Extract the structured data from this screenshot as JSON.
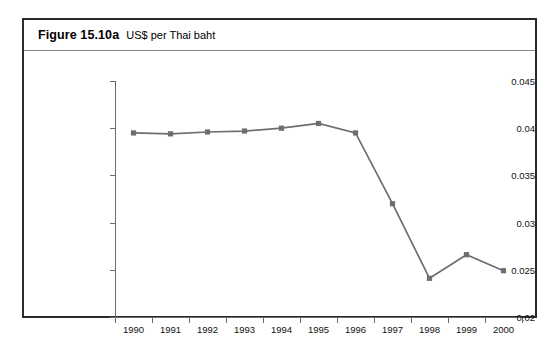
{
  "figure": {
    "number": "Figure 15.10a",
    "caption": "US$ per Thai baht"
  },
  "chart_data": {
    "type": "line",
    "title": "US$ per Thai baht",
    "xlabel": "",
    "ylabel": "",
    "categories": [
      "1990",
      "1991",
      "1992",
      "1993",
      "1994",
      "1995",
      "1996",
      "1997",
      "1998",
      "1999",
      "2000"
    ],
    "values": [
      0.0395,
      0.0394,
      0.0396,
      0.0397,
      0.04,
      0.0405,
      0.0395,
      0.032,
      0.0241,
      0.0266,
      0.0249
    ],
    "series": [
      {
        "name": "US$ per Thai baht",
        "values": [
          0.0395,
          0.0394,
          0.0396,
          0.0397,
          0.04,
          0.0405,
          0.0395,
          0.032,
          0.0241,
          0.0266,
          0.0249
        ]
      }
    ],
    "ylim": [
      0.02,
      0.045
    ],
    "yticks": [
      0.02,
      0.025,
      0.03,
      0.035,
      0.04,
      0.045
    ],
    "ytick_labels": [
      "0.02",
      "0.025",
      "0.03",
      "0.035",
      "0.04",
      "0.045"
    ],
    "grid": false,
    "legend": false,
    "marker": "square",
    "series_color": "#6e6e6e",
    "axis_color": "#6a6a6a",
    "frame_color": "#2b2b2b"
  }
}
